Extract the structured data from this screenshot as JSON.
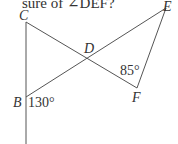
{
  "question": {
    "partial_text": "sure of ∠DEF?"
  },
  "diagram": {
    "points": {
      "C": {
        "label": "C",
        "x": 26,
        "y": 22
      },
      "B": {
        "label": "B",
        "x": 26,
        "y": 97
      },
      "D": {
        "label": "D",
        "x": 90,
        "y": 59
      },
      "E": {
        "label": "E",
        "x": 166,
        "y": 8
      },
      "F": {
        "label": "F",
        "x": 137,
        "y": 88
      }
    },
    "segments": [
      [
        "C",
        "F"
      ],
      [
        "B",
        "E"
      ],
      [
        "E",
        "F"
      ],
      [
        "C",
        "B-extended"
      ]
    ],
    "angles": {
      "B": {
        "value": "130°"
      },
      "F": {
        "value": "85°"
      }
    },
    "line_color": "#555555"
  }
}
